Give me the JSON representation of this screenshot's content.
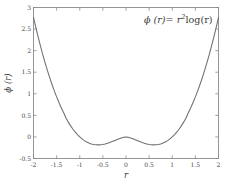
{
  "chart_data": {
    "type": "line",
    "title": "",
    "annotation": "ϕ (r) = r²log(r)",
    "annotation_parts": {
      "phi": "ϕ",
      "arg": "(r)",
      "equals": "=",
      "base": "r",
      "exponent": "2",
      "log": "log(r)"
    },
    "xlabel": "r",
    "ylabel": "ϕ (r)",
    "xlim": [
      -2,
      2
    ],
    "ylim": [
      -0.5,
      3
    ],
    "grid": false,
    "legend": null,
    "xticks": [
      -2,
      -1.5,
      -1,
      -0.5,
      0,
      0.5,
      1,
      1.5,
      2
    ],
    "xticklabels": [
      "-2",
      "-1.5",
      "-1",
      "-0.5",
      "0",
      "0.5",
      "1",
      "1.5",
      "2"
    ],
    "yticks": [
      -0.5,
      0,
      0.5,
      1,
      1.5,
      2,
      2.5,
      3
    ],
    "yticklabels": [
      "-0.5",
      "0",
      "0.5",
      "1",
      "1.5",
      "2",
      "2.5",
      "3"
    ],
    "series": [
      {
        "name": "ϕ (r) = r²log(r)",
        "color": "#6e6e6e",
        "x": [
          -2,
          -1.95,
          -1.9,
          -1.85,
          -1.8,
          -1.75,
          -1.7,
          -1.65,
          -1.6,
          -1.55,
          -1.5,
          -1.45,
          -1.4,
          -1.35,
          -1.3,
          -1.25,
          -1.2,
          -1.15,
          -1.1,
          -1.05,
          -1,
          -0.95,
          -0.9,
          -0.85,
          -0.8,
          -0.75,
          -0.7,
          -0.65,
          -0.6,
          -0.55,
          -0.5,
          -0.45,
          -0.4,
          -0.35,
          -0.3,
          -0.25,
          -0.2,
          -0.15,
          -0.1,
          -0.05,
          0,
          0.05,
          0.1,
          0.15,
          0.2,
          0.25,
          0.3,
          0.35,
          0.4,
          0.45,
          0.5,
          0.55,
          0.6,
          0.65,
          0.7,
          0.75,
          0.8,
          0.85,
          0.9,
          0.95,
          1,
          1.05,
          1.1,
          1.15,
          1.2,
          1.25,
          1.3,
          1.35,
          1.4,
          1.45,
          1.5,
          1.55,
          1.6,
          1.65,
          1.7,
          1.75,
          1.8,
          1.85,
          1.9,
          1.95,
          2
        ],
        "y": [
          2.7726,
          2.5398,
          2.3185,
          2.1084,
          1.9091,
          1.7205,
          1.5422,
          1.3741,
          1.2159,
          1.0674,
          0.9282,
          0.7983,
          0.6773,
          0.5651,
          0.4434,
          0.3486,
          0.2625,
          0.1847,
          0.1153,
          0.0539,
          0,
          -0.0463,
          -0.0854,
          -0.1173,
          -0.1428,
          -0.1618,
          -0.1748,
          -0.182,
          -0.1839,
          -0.1809,
          -0.1733,
          -0.1617,
          -0.1466,
          -0.1286,
          -0.1084,
          -0.0866,
          -0.0644,
          -0.0427,
          -0.023,
          -0.0075,
          0,
          -0.0075,
          -0.023,
          -0.0427,
          -0.0644,
          -0.0866,
          -0.1084,
          -0.1286,
          -0.1466,
          -0.1617,
          -0.1733,
          -0.1809,
          -0.1839,
          -0.182,
          -0.1748,
          -0.1618,
          -0.1428,
          -0.1173,
          -0.0854,
          -0.0463,
          0,
          0.0539,
          0.1153,
          0.1847,
          0.2625,
          0.3486,
          0.4434,
          0.5651,
          0.6773,
          0.7983,
          0.9282,
          1.0674,
          1.2159,
          1.3741,
          1.5422,
          1.7205,
          1.9091,
          2.1084,
          2.3185,
          2.5398,
          2.7726
        ]
      }
    ],
    "key_points": {
      "local_max": {
        "x": 0,
        "y": 0
      },
      "minima": [
        {
          "x": -0.607,
          "y": -0.184
        },
        {
          "x": 0.607,
          "y": -0.184
        }
      ],
      "endpoints": [
        {
          "x": -2,
          "y": 2.773
        },
        {
          "x": 2,
          "y": 2.773
        }
      ]
    },
    "colors": {
      "curve": "#6e6e6e",
      "axis": "#8a8a8a",
      "text": "#3b3b3b",
      "background": "#ffffff"
    }
  }
}
